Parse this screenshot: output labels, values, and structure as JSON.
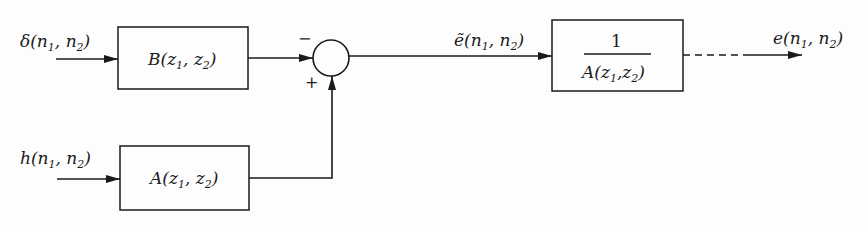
{
  "diagram": {
    "type": "block-diagram",
    "colors": {
      "ink": "#1a1a1a",
      "background": "#fdfdfd"
    },
    "inputs": [
      {
        "id": "delta",
        "label_main": "δ(n",
        "label_sub1": "1",
        "label_mid": ", n",
        "label_sub2": "2",
        "label_end": ")"
      },
      {
        "id": "h",
        "label_main": "h(n",
        "label_sub1": "1",
        "label_mid": ", n",
        "label_sub2": "2",
        "label_end": ")"
      }
    ],
    "blocks": [
      {
        "id": "B",
        "label_main": "B(z",
        "label_sub1": "1",
        "label_mid": ", z",
        "label_sub2": "2",
        "label_end": ")"
      },
      {
        "id": "A",
        "label_main": "A(z",
        "label_sub1": "1",
        "label_mid": ", z",
        "label_sub2": "2",
        "label_end": ")"
      },
      {
        "id": "invA",
        "numerator": "1",
        "den_main": "A(z",
        "den_sub1": "1",
        "den_mid": ",z",
        "den_sub2": "2",
        "den_end": ")"
      }
    ],
    "summing_junction": {
      "minus_sign": "−",
      "plus_sign": "+"
    },
    "signals": [
      {
        "id": "e_tilde",
        "label_main": "ẽ(n",
        "label_sub1": "1",
        "label_mid": ", n",
        "label_sub2": "2",
        "label_end": ")"
      },
      {
        "id": "e",
        "label_main": "e(n",
        "label_sub1": "1",
        "label_mid": ", n",
        "label_sub2": "2",
        "label_end": ")"
      }
    ]
  }
}
